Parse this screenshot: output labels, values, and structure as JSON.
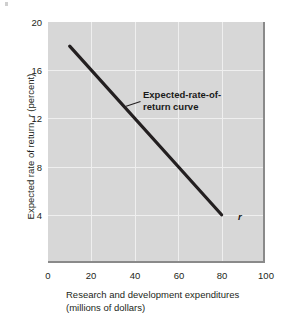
{
  "chart_data": {
    "type": "line",
    "title": "",
    "subtitle": "",
    "xlabel": "Research and development expenditures (millions of dollars)",
    "xlabel_line1": "Research and development expenditures",
    "xlabel_line2": "(millions of dollars)",
    "ylabel": "Expected rate of return, r (percent)",
    "ylabel_prefix": "Expected rate of return, ",
    "ylabel_symbol": "r",
    "ylabel_suffix": " (percent)",
    "xlim": [
      0,
      100
    ],
    "ylim": [
      0,
      20
    ],
    "xticks": [
      "0",
      "20",
      "40",
      "60",
      "80",
      "100"
    ],
    "yticks": [
      "4",
      "8",
      "12",
      "16",
      "20"
    ],
    "grid": true,
    "legend": "none",
    "series": [
      {
        "name": "Expected-rate-of-return curve",
        "symbol": "r",
        "x": [
          10,
          80
        ],
        "values": [
          18,
          4
        ],
        "points": [
          {
            "x": 10,
            "y": 18
          },
          {
            "x": 20,
            "y": 16
          },
          {
            "x": 40,
            "y": 12
          },
          {
            "x": 60,
            "y": 8
          },
          {
            "x": 80,
            "y": 4
          }
        ]
      }
    ],
    "annotations": [
      {
        "name": "curve-label",
        "line1": "Expected-rate-of-",
        "line2": "return curve",
        "text": "Expected-rate-of-return curve",
        "points_to": {
          "x": 36,
          "y": 13
        }
      },
      {
        "name": "endpoint-label",
        "text": "r",
        "points_to": {
          "x": 80,
          "y": 4
        }
      }
    ],
    "colors": {
      "plot_background": "#d7d7d7",
      "gridline": "#efefef",
      "data_line": "#231f20",
      "axis": "#8a8a8a",
      "text": "#231f20",
      "page_background": "#ffffff"
    }
  }
}
